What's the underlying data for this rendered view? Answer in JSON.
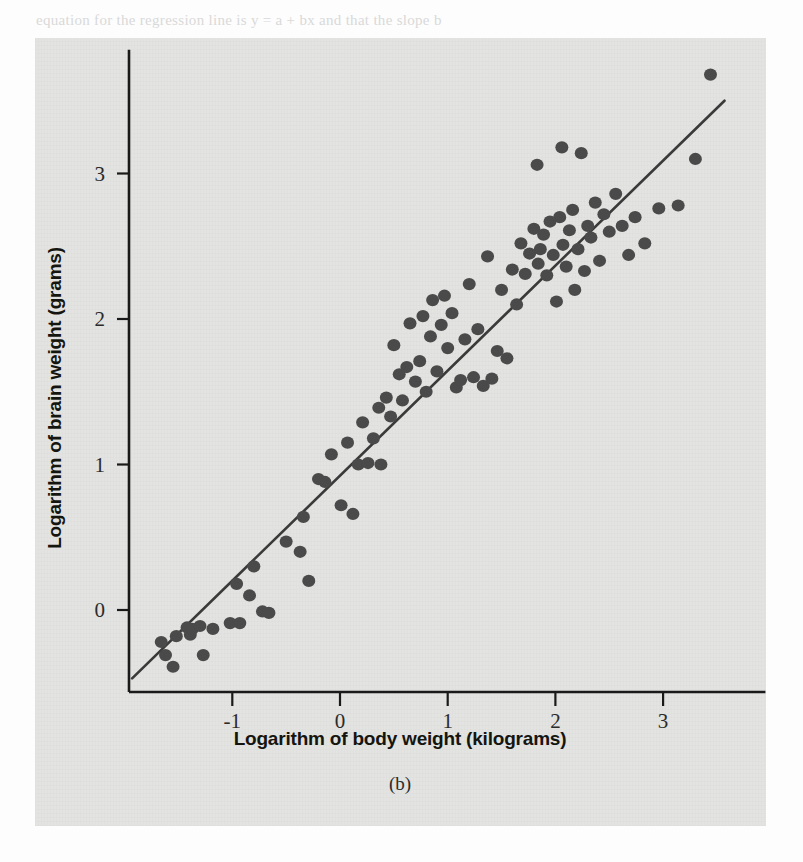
{
  "page": {
    "background_color": "#fdfdfd",
    "panel_color": "#e3e3e1",
    "ink_color": "#1a1a1a",
    "point_color": "#4a4a4a",
    "bleed_text": [
      {
        "text": "equation for the regression line is y = a + bx and that the slope b",
        "x": 36,
        "y": 12,
        "bold": false
      },
      {
        "text": "predicted values",
        "x": 40,
        "y": 58,
        "bold": true
      },
      {
        "text": "are interpreted are two possible. For the explanation of the sta-",
        "x": 78,
        "y": 82,
        "bold": false
      },
      {
        "text": "tistic called the R-squared, or R 2, is also helpful. The R-squared",
        "x": 78,
        "y": 104,
        "bold": false
      },
      {
        "text": "value is a measure of how well the above regression line fits the",
        "x": 78,
        "y": 126,
        "bold": false
      },
      {
        "text": "data, how much variation it explains, by looking at the residuals",
        "x": 78,
        "y": 148,
        "bold": false
      },
      {
        "text": "from",
        "x": 78,
        "y": 170,
        "bold": false
      },
      {
        "text": "Consider, again, the data on the weight of bodies and brains of",
        "x": 78,
        "y": 216,
        "bold": false
      },
      {
        "text": "animals, and the regression model fitted above. A scatterplot",
        "x": 78,
        "y": 238,
        "bold": false
      },
      {
        "text": "of the data is shown in Figure 8.7(a) and makes the relation-",
        "x": 78,
        "y": 260,
        "bold": false
      },
      {
        "text": "ship very nonlinear. It is much clearer when the data are first",
        "x": 78,
        "y": 282,
        "bold": false
      },
      {
        "text": "transformed by a log transformation (natural logarithms).",
        "x": 78,
        "y": 304,
        "bold": false
      },
      {
        "text": "8.3.2  Using a regression model for prediction",
        "x": 90,
        "y": 360,
        "bold": true
      },
      {
        "text": "Once we have fitted a regression model to our data, it is often",
        "x": 78,
        "y": 402,
        "bold": false
      },
      {
        "text": "useful to be able to use it to predict. One of the simplest and",
        "x": 78,
        "y": 424,
        "bold": false
      },
      {
        "text": "most useful of these is the prediction of a new response given",
        "x": 78,
        "y": 446,
        "bold": false
      },
      {
        "text": "a new value of the explanatory variable. For the brain and body",
        "x": 78,
        "y": 468,
        "bold": false
      },
      {
        "text": "weight data, suppose we knew the body weight of a new species",
        "x": 78,
        "y": 490,
        "bold": false
      },
      {
        "text": "and wanted to predict the brain weight. To do this we simply",
        "x": 78,
        "y": 512,
        "bold": false
      },
      {
        "text": "substitute the value into the fitted regression equation to obtain",
        "x": 78,
        "y": 534,
        "bold": false
      },
      {
        "text": "the predicted value of the response.",
        "x": 78,
        "y": 556,
        "bold": false
      }
    ]
  },
  "figure": {
    "caption": "(b)",
    "x_axis": {
      "title": "Logarithm of body weight (kilograms)",
      "tick_labels": [
        "-1",
        "0",
        "1",
        "2",
        "3"
      ],
      "tick_values": [
        -1,
        0,
        1,
        2,
        3
      ]
    },
    "y_axis": {
      "title": "Logarithm of brain weight (grams)",
      "tick_labels": [
        "0",
        "1",
        "2",
        "3"
      ],
      "tick_values": [
        0,
        1,
        2,
        3
      ]
    }
  },
  "chart_data": {
    "type": "scatter",
    "title": "",
    "xlabel": "Logarithm of body weight (kilograms)",
    "ylabel": "Logarithm of brain weight (grams)",
    "xlim": [
      -2.0,
      3.95
    ],
    "ylim": [
      -0.7,
      3.85
    ],
    "xticks": [
      -1,
      0,
      1,
      2,
      3
    ],
    "yticks": [
      0,
      1,
      2,
      3
    ],
    "grid": false,
    "legend": null,
    "marker": "filled-circle",
    "marker_color": "#4a4a4a",
    "marker_radius_px": 6.5,
    "fit_line": {
      "type": "linear-regression",
      "color": "#3a3a3a",
      "x_start": -1.93,
      "y_start": -0.47,
      "x_end": 3.57,
      "y_end": 3.5,
      "slope": 0.722,
      "intercept": 0.927
    },
    "points": [
      [
        -1.66,
        -0.22
      ],
      [
        -1.62,
        -0.31
      ],
      [
        -1.55,
        -0.39
      ],
      [
        -1.52,
        -0.18
      ],
      [
        -1.42,
        -0.12
      ],
      [
        -1.39,
        -0.17
      ],
      [
        -1.37,
        -0.13
      ],
      [
        -1.3,
        -0.11
      ],
      [
        -1.27,
        -0.31
      ],
      [
        -1.18,
        -0.13
      ],
      [
        -1.02,
        -0.09
      ],
      [
        -0.96,
        0.18
      ],
      [
        -0.93,
        -0.09
      ],
      [
        -0.84,
        0.1
      ],
      [
        -0.8,
        0.3
      ],
      [
        -0.72,
        -0.01
      ],
      [
        -0.66,
        -0.02
      ],
      [
        -0.5,
        0.47
      ],
      [
        -0.37,
        0.4
      ],
      [
        -0.34,
        0.64
      ],
      [
        -0.29,
        0.2
      ],
      [
        -0.2,
        0.9
      ],
      [
        -0.14,
        0.88
      ],
      [
        -0.08,
        1.07
      ],
      [
        0.01,
        0.72
      ],
      [
        0.07,
        1.15
      ],
      [
        0.12,
        0.66
      ],
      [
        0.17,
        1.0
      ],
      [
        0.21,
        1.29
      ],
      [
        0.26,
        1.01
      ],
      [
        0.31,
        1.18
      ],
      [
        0.36,
        1.39
      ],
      [
        0.38,
        1.0
      ],
      [
        0.43,
        1.46
      ],
      [
        0.47,
        1.33
      ],
      [
        0.5,
        1.82
      ],
      [
        0.55,
        1.62
      ],
      [
        0.58,
        1.44
      ],
      [
        0.62,
        1.67
      ],
      [
        0.65,
        1.97
      ],
      [
        0.7,
        1.57
      ],
      [
        0.74,
        1.71
      ],
      [
        0.77,
        2.02
      ],
      [
        0.8,
        1.5
      ],
      [
        0.84,
        1.88
      ],
      [
        0.86,
        2.13
      ],
      [
        0.9,
        1.64
      ],
      [
        0.94,
        1.96
      ],
      [
        0.97,
        2.16
      ],
      [
        1.0,
        1.8
      ],
      [
        1.04,
        2.04
      ],
      [
        1.08,
        1.53
      ],
      [
        1.12,
        1.58
      ],
      [
        1.16,
        1.86
      ],
      [
        1.2,
        2.24
      ],
      [
        1.24,
        1.6
      ],
      [
        1.28,
        1.93
      ],
      [
        1.33,
        1.54
      ],
      [
        1.37,
        2.43
      ],
      [
        1.41,
        1.59
      ],
      [
        1.46,
        1.78
      ],
      [
        1.5,
        2.2
      ],
      [
        1.55,
        1.73
      ],
      [
        1.6,
        2.34
      ],
      [
        1.64,
        2.1
      ],
      [
        1.68,
        2.52
      ],
      [
        1.72,
        2.31
      ],
      [
        1.76,
        2.45
      ],
      [
        1.8,
        2.62
      ],
      [
        1.84,
        2.38
      ],
      [
        1.86,
        2.48
      ],
      [
        1.89,
        2.58
      ],
      [
        1.92,
        2.3
      ],
      [
        1.95,
        2.67
      ],
      [
        1.98,
        2.44
      ],
      [
        2.01,
        2.12
      ],
      [
        2.04,
        2.7
      ],
      [
        2.07,
        2.51
      ],
      [
        2.1,
        2.36
      ],
      [
        2.13,
        2.61
      ],
      [
        2.16,
        2.75
      ],
      [
        2.18,
        2.2
      ],
      [
        2.21,
        2.48
      ],
      [
        2.24,
        3.14
      ],
      [
        2.27,
        2.33
      ],
      [
        2.3,
        2.64
      ],
      [
        2.33,
        2.56
      ],
      [
        2.37,
        2.8
      ],
      [
        2.41,
        2.4
      ],
      [
        2.45,
        2.72
      ],
      [
        2.5,
        2.6
      ],
      [
        2.56,
        2.86
      ],
      [
        2.62,
        2.64
      ],
      [
        2.68,
        2.44
      ],
      [
        2.74,
        2.7
      ],
      [
        2.83,
        2.52
      ],
      [
        2.96,
        2.76
      ],
      [
        3.14,
        2.78
      ],
      [
        3.3,
        3.1
      ],
      [
        3.44,
        3.68
      ],
      [
        1.83,
        3.06
      ],
      [
        2.06,
        3.18
      ]
    ]
  }
}
